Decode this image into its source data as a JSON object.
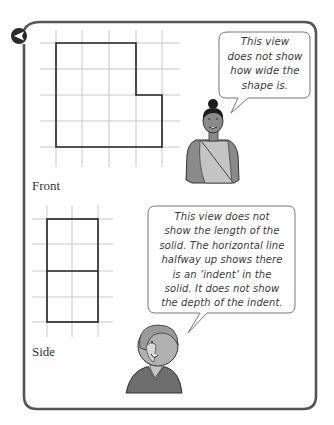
{
  "figure": {
    "front": {
      "label": "Front",
      "grid": {
        "cols_x": [
          56,
          82,
          109,
          136,
          162
        ],
        "rows_y": [
          43,
          69,
          95,
          121,
          147
        ],
        "line_color": "#c8c8c8"
      },
      "outline_points": "56,43 136,43 136,95 162,95 162,147 56,147"
    },
    "side": {
      "label": "Side",
      "grid": {
        "cols_x": [
          47,
          72,
          98
        ],
        "rows_y": [
          219,
          244,
          271,
          297,
          322
        ],
        "line_color": "#c8c8c8"
      },
      "outline_points": "47,219 98,219 98,322 47,322",
      "divider_y": 271
    }
  },
  "speech_bubbles": [
    {
      "speaker": "woman",
      "lines": [
        "This view",
        "does not show",
        "how wide the",
        "shape is."
      ]
    },
    {
      "speaker": "person",
      "lines": [
        "This view does not",
        "show the length of the",
        "solid. The horizontal line",
        "halfway up shows there",
        "is an ‘indent’ in the",
        "solid. It does not show",
        "the depth of the indent."
      ]
    }
  ],
  "colors": {
    "frame": "#555555",
    "outline": "#222222",
    "figure_gray": "#8a8a8a",
    "figure_light": "#c4c4c4"
  },
  "icons": {
    "corner_marker": "left-arrow-circle-icon"
  }
}
